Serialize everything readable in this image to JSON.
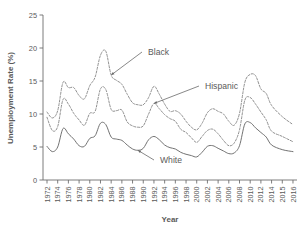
{
  "chart_data": {
    "type": "line",
    "title": "",
    "xlabel": "Year",
    "ylabel": "Unemployment Rate (%)",
    "ylim": [
      0,
      25
    ],
    "yticks": [
      0,
      5,
      10,
      15,
      20,
      25
    ],
    "xlim": [
      1972,
      2016
    ],
    "xtick_labels": [
      "1972",
      "1974",
      "1976",
      "1978",
      "1980",
      "1982",
      "1984",
      "1986",
      "1988",
      "1990",
      "1992",
      "1994",
      "1996",
      "1998",
      "2000",
      "2002",
      "2004",
      "2006",
      "2008",
      "2010",
      "2012",
      "2014",
      "2015",
      "2016"
    ],
    "grid": false,
    "legend_position": "inline-annotations",
    "annotations": [
      {
        "text": "Black",
        "series": "Black",
        "x": 1984,
        "y": 15.9
      },
      {
        "text": "Hispanic",
        "series": "Hispanic",
        "x": 1992,
        "y": 11.6
      },
      {
        "text": "White",
        "series": "White",
        "x": 1989,
        "y": 4.5
      }
    ],
    "x": [
      1972,
      1973,
      1974,
      1975,
      1976,
      1977,
      1978,
      1979,
      1980,
      1981,
      1982,
      1983,
      1984,
      1985,
      1986,
      1987,
      1988,
      1989,
      1990,
      1991,
      1992,
      1993,
      1994,
      1995,
      1996,
      1997,
      1998,
      1999,
      2000,
      2001,
      2002,
      2003,
      2004,
      2005,
      2006,
      2007,
      2008,
      2009,
      2010,
      2011,
      2012,
      2013,
      2014,
      2015,
      2016
    ],
    "series": [
      {
        "name": "Black",
        "style": "dashed",
        "color": "#8a8a8a",
        "values": [
          10.3,
          9.4,
          10.5,
          14.8,
          14.0,
          14.0,
          12.8,
          12.3,
          14.3,
          15.6,
          18.9,
          19.5,
          15.9,
          15.1,
          14.5,
          13.0,
          11.7,
          11.4,
          11.4,
          12.5,
          14.2,
          13.0,
          11.5,
          10.4,
          10.5,
          10.0,
          8.9,
          8.0,
          7.6,
          8.6,
          10.2,
          10.8,
          10.4,
          10.0,
          8.9,
          8.3,
          10.1,
          14.8,
          16.0,
          15.8,
          13.8,
          13.1,
          11.3,
          9.6,
          8.4
        ]
      },
      {
        "name": "Hispanic",
        "style": "dashed",
        "color": "#8a8a8a",
        "values": [
          9.5,
          7.5,
          8.1,
          12.2,
          11.5,
          10.1,
          9.1,
          8.3,
          10.1,
          10.4,
          13.8,
          13.7,
          10.7,
          10.5,
          10.6,
          8.8,
          8.2,
          8.0,
          8.2,
          10.0,
          11.6,
          10.8,
          9.9,
          9.3,
          8.9,
          7.7,
          7.2,
          6.4,
          5.7,
          6.6,
          7.5,
          7.7,
          7.0,
          6.0,
          5.2,
          5.6,
          7.6,
          12.1,
          12.5,
          11.5,
          10.3,
          9.1,
          7.4,
          6.6,
          5.8
        ]
      },
      {
        "name": "White",
        "style": "solid",
        "color": "#6a6a6a",
        "values": [
          5.1,
          4.3,
          5.0,
          7.8,
          7.0,
          6.2,
          5.2,
          5.1,
          6.3,
          6.7,
          8.6,
          8.4,
          6.5,
          6.2,
          6.0,
          5.3,
          4.7,
          4.5,
          4.8,
          6.1,
          6.6,
          6.1,
          5.3,
          4.9,
          4.7,
          4.2,
          3.9,
          3.7,
          3.5,
          4.2,
          5.1,
          5.2,
          4.8,
          4.4,
          4.0,
          4.1,
          5.2,
          8.5,
          8.7,
          7.9,
          7.2,
          6.5,
          5.3,
          4.6,
          4.3
        ]
      }
    ]
  }
}
